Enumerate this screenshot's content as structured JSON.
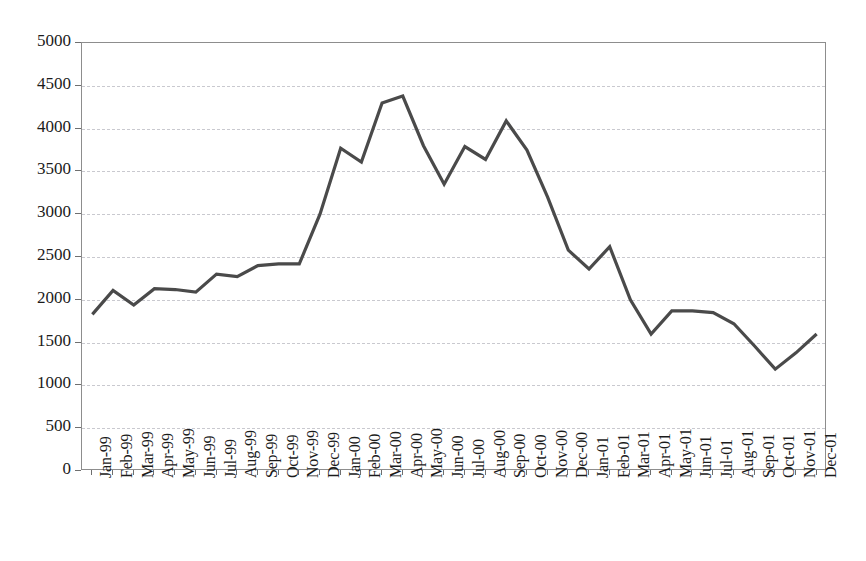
{
  "chart_data": {
    "type": "line",
    "title": "",
    "subtitle": "",
    "xlabel": "",
    "ylabel": "",
    "ylim": [
      0,
      5000
    ],
    "y_ticks": [
      0,
      500,
      1000,
      1500,
      2000,
      2500,
      3000,
      3500,
      4000,
      4500,
      5000
    ],
    "y_tick_labels": [
      "0",
      "500",
      "1000",
      "1500",
      "2000",
      "2500",
      "3000",
      "3500",
      "4000",
      "4500",
      "5000"
    ],
    "grid": "horizontal-dashed",
    "legend": "none",
    "series_color": "#4a4a4a",
    "axis_color": "#8d8d8d",
    "gridline_color": "#c9c9cf",
    "categories": [
      "Jan-99",
      "Feb-99",
      "Mar-99",
      "Apr-99",
      "May-99",
      "Jun-99",
      "Jul-99",
      "Aug-99",
      "Sep-99",
      "Oct-99",
      "Nov-99",
      "Dec-99",
      "Jan-00",
      "Feb-00",
      "Mar-00",
      "Apr-00",
      "May-00",
      "Jun-00",
      "Jul-00",
      "Aug-00",
      "Sep-00",
      "Oct-00",
      "Nov-00",
      "Dec-00",
      "Jan-01",
      "Feb-01",
      "Mar-01",
      "Apr-01",
      "May-01",
      "Jun-01",
      "Jul-01",
      "Aug-01",
      "Sep-01",
      "Oct-01",
      "Nov-01",
      "Dec-01"
    ],
    "values": [
      1830,
      2110,
      1940,
      2130,
      2120,
      2090,
      2300,
      2270,
      2400,
      2420,
      2420,
      3000,
      3770,
      3610,
      4300,
      4380,
      3800,
      3350,
      3790,
      3640,
      4090,
      3750,
      3200,
      2580,
      2360,
      2620,
      2000,
      1600,
      1870,
      1870,
      1850,
      1720,
      1460,
      1190,
      1380,
      1600
    ]
  }
}
